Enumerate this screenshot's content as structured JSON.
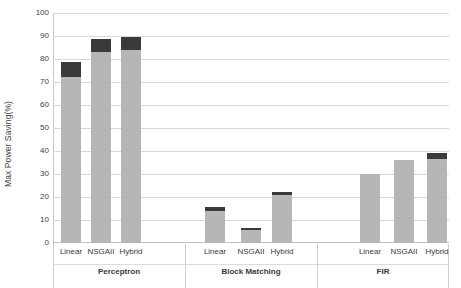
{
  "chart_data": {
    "type": "bar",
    "title": "",
    "subtitle": "",
    "xlabel": "",
    "ylabel": "Max Power Saving(%)",
    "ylim": [
      0,
      100
    ],
    "ytick_labels": [
      "100",
      "90",
      "80",
      "70",
      "60",
      "50",
      "40",
      "30",
      "20",
      "10",
      "0"
    ],
    "ytick_values": [
      100,
      90,
      80,
      70,
      60,
      50,
      40,
      30,
      20,
      10,
      0
    ],
    "grid": true,
    "legend": "none",
    "stacked": true,
    "series": [
      {
        "name": "light-segment",
        "color": "#b6b6b6",
        "values": [
          72,
          83,
          84,
          14,
          5.5,
          21,
          30,
          36,
          36.5
        ]
      },
      {
        "name": "dark-segment",
        "color": "#3a3a3a",
        "values": [
          6.5,
          5.7,
          5.5,
          1.6,
          1.0,
          1.0,
          0,
          0,
          2.5
        ]
      }
    ],
    "categories": [
      "Linear",
      "NSGAII",
      "Hybrid",
      "Linear",
      "NSGAII",
      "Hybrid",
      "Linear",
      "NSGAII",
      "Hybrid"
    ],
    "totals": [
      78.5,
      88.7,
      89.5,
      15.6,
      6.5,
      22.0,
      30.0,
      36.0,
      39.0
    ],
    "groups": [
      {
        "label": "Perceptron",
        "categories": [
          "Linear",
          "NSGAII",
          "Hybrid"
        ],
        "totals": [
          78.5,
          88.7,
          89.5
        ]
      },
      {
        "label": "Block Matching",
        "categories": [
          "Linear",
          "NSGAII",
          "Hybrid"
        ],
        "totals": [
          15.6,
          6.5,
          22.0
        ]
      },
      {
        "label": "FIR",
        "categories": [
          "Linear",
          "NSGAII",
          "Hybrid"
        ],
        "totals": [
          30.0,
          36.0,
          39.0
        ]
      }
    ]
  },
  "axis": {
    "y_title": "Max Power Saving(%)",
    "ticks": {
      "t100": "100",
      "t90": "90",
      "t80": "80",
      "t70": "70",
      "t60": "60",
      "t50": "50",
      "t40": "40",
      "t30": "30",
      "t20": "20",
      "t10": "10",
      "t0": "0"
    }
  },
  "categories_text": {
    "g0c0": "Linear",
    "g0c1": "NSGAII",
    "g0c2": "Hybrid",
    "g0": "Perceptron",
    "g1c0": "Linear",
    "g1c1": "NSGAII",
    "g1c2": "Hybrid",
    "g1": "Block Matching",
    "g2c0": "Linear",
    "g2c1": "NSGAII",
    "g2c2": "Hybrid",
    "g2": "FIR"
  },
  "colors": {
    "bar_light": "#b6b6b6",
    "bar_dark": "#3a3a3a",
    "gridline": "#d9d9d9",
    "axis": "#bfbfbf",
    "text": "#3a3a3a",
    "background": "#ffffff"
  }
}
